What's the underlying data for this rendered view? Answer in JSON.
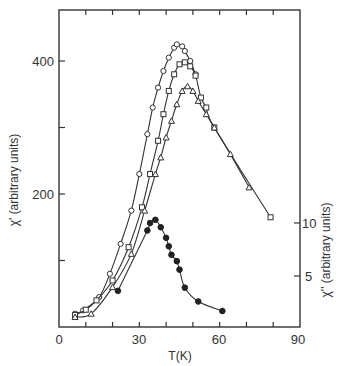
{
  "chart_data": {
    "type": "line",
    "title": "",
    "xlabel": "T(K)",
    "ylabel": "χ' (arbitrary units)",
    "y2label": "χ'' (arbitrary units)",
    "xlim": [
      0,
      90
    ],
    "ylim": [
      0,
      460
    ],
    "y2lim": [
      0,
      20
    ],
    "x_ticks": [
      0,
      30,
      60,
      90
    ],
    "y_ticks": [
      200,
      400
    ],
    "y2_ticks": [
      5,
      10
    ],
    "grid": false,
    "legend": null,
    "series": [
      {
        "name": "χ' (open circles)",
        "axis": "left",
        "marker": "open-circle",
        "x": [
          6,
          9,
          15,
          19,
          23,
          27,
          30,
          33,
          35,
          37,
          39,
          41,
          43,
          44,
          46,
          47,
          49,
          51
        ],
        "y": [
          20,
          25,
          45,
          80,
          125,
          175,
          230,
          290,
          330,
          360,
          385,
          405,
          420,
          425,
          422,
          415,
          400,
          380
        ]
      },
      {
        "name": "χ' (open squares)",
        "axis": "left",
        "marker": "open-square",
        "x": [
          6,
          10,
          14,
          20,
          26,
          31,
          34,
          37,
          39,
          41,
          43,
          45,
          47,
          49,
          51,
          53,
          55,
          58,
          79
        ],
        "y": [
          18,
          26,
          40,
          70,
          120,
          180,
          230,
          280,
          320,
          355,
          380,
          395,
          398,
          392,
          378,
          345,
          330,
          300,
          165
        ]
      },
      {
        "name": "χ' (open triangles)",
        "axis": "left",
        "marker": "open-triangle",
        "x": [
          6,
          12,
          20,
          27,
          32,
          36,
          38,
          40,
          42,
          44,
          46,
          48,
          50,
          52,
          55,
          58,
          64,
          71
        ],
        "y": [
          15,
          20,
          60,
          110,
          175,
          230,
          255,
          285,
          310,
          335,
          355,
          362,
          355,
          340,
          320,
          300,
          260,
          210
        ]
      },
      {
        "name": "χ'' (filled circles)",
        "axis": "right",
        "marker": "filled-circle",
        "x": [
          22,
          33,
          34,
          36,
          38,
          40,
          41,
          42,
          44,
          45,
          47,
          52,
          61
        ],
        "y": [
          3.6,
          9.3,
          10.0,
          10.3,
          9.6,
          8.6,
          7.8,
          7.0,
          6.4,
          5.6,
          3.9,
          2.6,
          1.7
        ]
      }
    ]
  },
  "axes": {
    "x_label": "T(K)",
    "y_label": "χ' (arbitrary units)",
    "y2_label": "χ'' (arbitrary units)",
    "x_tick_labels": [
      "0",
      "30",
      "60",
      "90"
    ],
    "y_tick_labels": [
      "200",
      "400"
    ],
    "y2_tick_labels": [
      "5",
      "10"
    ]
  }
}
